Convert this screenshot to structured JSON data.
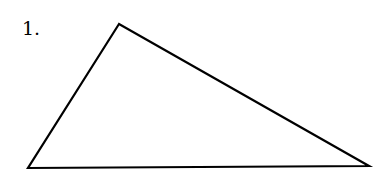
{
  "problem": {
    "number_label": "1."
  },
  "figure": {
    "shape": "triangle",
    "stroke_color": "#000000",
    "fill_color": "none",
    "stroke_width": 2.2,
    "vertices": [
      {
        "name": "top",
        "x": 119,
        "y": 24
      },
      {
        "name": "bottom-left",
        "x": 28,
        "y": 168
      },
      {
        "name": "bottom-right",
        "x": 369,
        "y": 166
      }
    ]
  }
}
